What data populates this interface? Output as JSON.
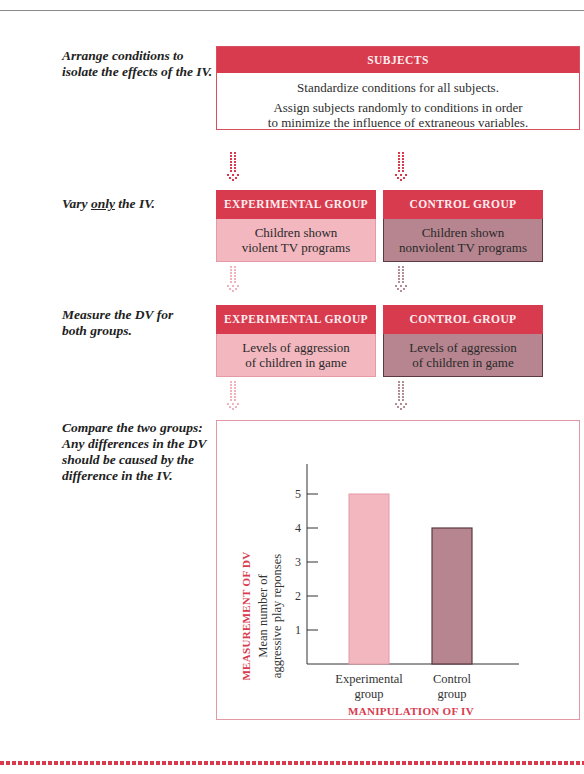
{
  "steps": [
    {
      "label_lines": [
        "Arrange conditions to",
        "isolate the effects of the IV."
      ]
    },
    {
      "label_pre": "Vary ",
      "label_emph": "only",
      "label_post": " the IV."
    },
    {
      "label_lines": [
        "Measure the DV for",
        "both groups."
      ]
    },
    {
      "label_lines": [
        "Compare the two groups:",
        "Any differences in the DV",
        "should be caused by the",
        "difference in the IV."
      ]
    }
  ],
  "subjects": {
    "header": "SUBJECTS",
    "line1": "Standardize conditions for all subjects.",
    "line2a": "Assign subjects randomly to conditions in order",
    "line2b": "to minimize the influence of extraneous variables."
  },
  "manipulation": {
    "experimental": {
      "header": "EXPERIMENTAL GROUP",
      "line1": "Children shown",
      "line2": "violent TV programs"
    },
    "control": {
      "header": "CONTROL GROUP",
      "line1": "Children shown",
      "line2": "nonviolent TV programs"
    }
  },
  "measurement": {
    "experimental": {
      "header": "EXPERIMENTAL GROUP",
      "line1": "Levels of aggression",
      "line2": "of children in game"
    },
    "control": {
      "header": "CONTROL GROUP",
      "line1": "Levels of aggression",
      "line2": "of children in game"
    }
  },
  "colors": {
    "accent_red": "#d93b4e",
    "experimental_fill": "#f2b7bf",
    "control_fill": "#b6858f",
    "control_border": "#5a3a40"
  },
  "chart_data": {
    "type": "bar",
    "categories": [
      "Experimental group",
      "Control group"
    ],
    "category_lines": [
      [
        "Experimental",
        "group"
      ],
      [
        "Control",
        "group"
      ]
    ],
    "values": [
      5,
      4
    ],
    "title": "",
    "xlabel": "MANIPULATION OF IV",
    "ylabel_outer": "MEASUREMENT OF DV",
    "ylabel_lines": [
      "Mean number of",
      "aggressive play reponses"
    ],
    "yticks": [
      1,
      2,
      3,
      4,
      5
    ],
    "ylim": [
      0,
      6
    ],
    "grid": false,
    "legend": "none"
  }
}
